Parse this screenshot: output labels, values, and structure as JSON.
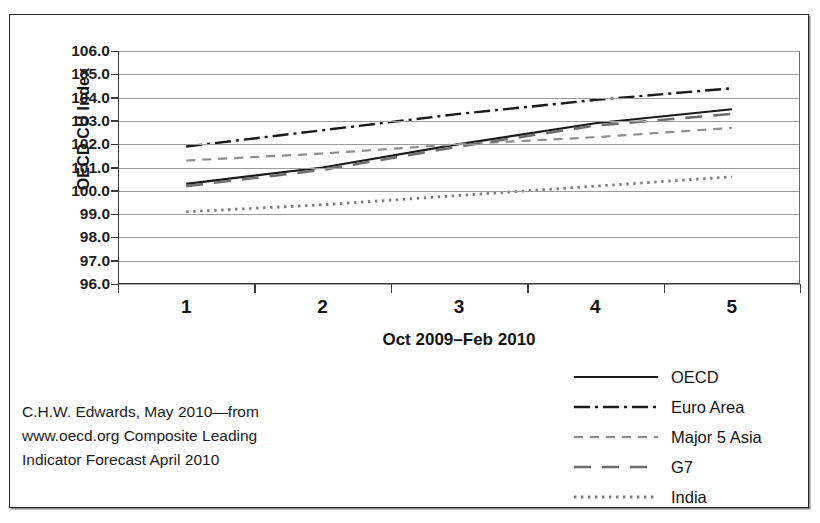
{
  "figure": {
    "caption_lines": [
      "C.H.W. Edwards, May 2010—from",
      "www.oecd.org Composite Leading",
      "Indicator Forecast April 2010"
    ]
  },
  "chart_data": {
    "type": "line",
    "title": "",
    "xlabel": "Oct 2009–Feb 2010",
    "ylabel": "OECD CU Index",
    "x": [
      1,
      2,
      3,
      4,
      5
    ],
    "xtick_labels": [
      "1",
      "2",
      "3",
      "4",
      "5"
    ],
    "ytick_labels": [
      "106.0",
      "105.0",
      "104.0",
      "103.0",
      "102.0",
      "101.0",
      "100.0",
      "99.0",
      "98.0",
      "97.0",
      "96.0"
    ],
    "ytick_values": [
      106.0,
      105.0,
      104.0,
      103.0,
      102.0,
      101.0,
      100.0,
      99.0,
      98.0,
      97.0,
      96.0
    ],
    "ylim": [
      96.0,
      106.0
    ],
    "xlim": [
      0.5,
      5.5
    ],
    "grid": true,
    "legend_position": "below-right",
    "series": [
      {
        "name": "OECD",
        "values": [
          100.3,
          101.0,
          102.0,
          102.9,
          103.5
        ],
        "style": "solid",
        "color": "#1a1a1a"
      },
      {
        "name": "Euro Area",
        "values": [
          101.9,
          102.6,
          103.3,
          103.9,
          104.4
        ],
        "style": "dash-dot",
        "color": "#1a1a1a"
      },
      {
        "name": "Major 5 Asia",
        "values": [
          101.3,
          101.6,
          102.0,
          102.3,
          102.7
        ],
        "style": "short-dash",
        "color": "#8e8e8e"
      },
      {
        "name": "G7",
        "values": [
          100.2,
          100.9,
          101.9,
          102.8,
          103.3
        ],
        "style": "long-dash",
        "color": "#6e6e6e"
      },
      {
        "name": "India",
        "values": [
          99.1,
          99.4,
          99.8,
          100.2,
          100.6
        ],
        "style": "dotted",
        "color": "#7a7a7a"
      }
    ]
  }
}
